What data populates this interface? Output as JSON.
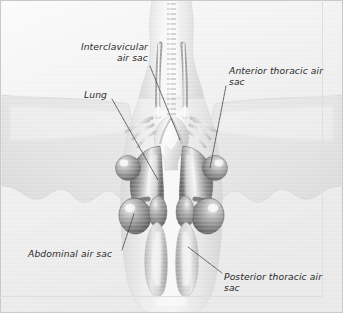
{
  "figure": {
    "view": "ventral",
    "width": 343,
    "height": 313,
    "style": "grayscale medical illustration with scanline texture"
  },
  "colors": {
    "background": "#f2f2f2",
    "frame_border": "#c9c9c9",
    "body_fill_light": "#ededed",
    "body_fill_mid": "#dcdcdc",
    "wing_fill": "#e6e6e6",
    "wing_edge": "#cfcfcf",
    "trachea": "#d9d9d9",
    "trachea_ring": "#b0b0b0",
    "lung_dark": "#6e6e6e",
    "lung_mid": "#9a9a9a",
    "sac_dark": "#707070",
    "sac_light": "#d2d2d2",
    "leader_line": "#3a3a3a",
    "label_text": "#2b2b2b"
  },
  "labels": [
    {
      "id": "interclavicular",
      "name": "interclavicular-air-sac-label",
      "lines": [
        "Interclavicular",
        "air sac"
      ],
      "align": "right",
      "x": 30,
      "y": 42,
      "width": 118,
      "leader": {
        "x1": 150,
        "y1": 66,
        "x2": 180,
        "y2": 140
      }
    },
    {
      "id": "lung",
      "name": "lung-label",
      "lines": [
        "Lung"
      ],
      "align": "right",
      "x": 40,
      "y": 90,
      "width": 67,
      "leader": {
        "x1": 112,
        "y1": 99,
        "x2": 158,
        "y2": 180
      }
    },
    {
      "id": "anterior_thoracic",
      "name": "anterior-thoracic-air-sac-label",
      "lines": [
        "Anterior thoracic air",
        "sac"
      ],
      "align": "left",
      "x": 229,
      "y": 66,
      "width": 110,
      "leader": {
        "x1": 226,
        "y1": 86,
        "x2": 210,
        "y2": 168
      }
    },
    {
      "id": "abdominal",
      "name": "abdominal-air-sac-label",
      "lines": [
        "Abdominal air sac"
      ],
      "align": "left",
      "x": 28,
      "y": 249,
      "width": 100,
      "leader": {
        "x1": 122,
        "y1": 250,
        "x2": 134,
        "y2": 214
      }
    },
    {
      "id": "posterior_thoracic",
      "name": "posterior-thoracic-air-sac-label",
      "lines": [
        "Posterior thoracic air",
        "sac"
      ],
      "align": "left",
      "x": 224,
      "y": 272,
      "width": 112,
      "leader": {
        "x1": 222,
        "y1": 273,
        "x2": 188,
        "y2": 247
      }
    }
  ],
  "structures": [
    {
      "name": "trachea",
      "label": "trachea"
    },
    {
      "name": "cervical-vessels",
      "label": "cervical vessels"
    },
    {
      "name": "syrinx",
      "label": "syrinx"
    },
    {
      "name": "left-lung",
      "label": "left lung"
    },
    {
      "name": "right-lung",
      "label": "right lung"
    },
    {
      "name": "left-anterior-thoracic-sac",
      "label": "left anterior thoracic air sac"
    },
    {
      "name": "right-anterior-thoracic-sac",
      "label": "right anterior thoracic air sac"
    },
    {
      "name": "left-abdominal-sac",
      "label": "left abdominal air sac"
    },
    {
      "name": "right-abdominal-sac",
      "label": "right abdominal air sac"
    },
    {
      "name": "left-posterior-thoracic-sac",
      "label": "left posterior thoracic air sac"
    },
    {
      "name": "right-posterior-thoracic-sac",
      "label": "right posterior thoracic air sac"
    },
    {
      "name": "left-wing",
      "label": "left wing silhouette"
    },
    {
      "name": "right-wing",
      "label": "right wing silhouette"
    },
    {
      "name": "body-outline",
      "label": "bird body outline"
    }
  ]
}
